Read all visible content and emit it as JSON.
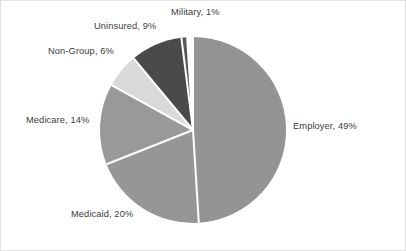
{
  "chart_data": {
    "type": "pie",
    "title": "",
    "subtitle": "",
    "xlabel": "",
    "ylabel": "",
    "legend_position": "none",
    "grid": false,
    "labels_format": "{name}, {value}%",
    "start_angle_deg": 0,
    "direction": "clockwise",
    "categories": [
      "Employer",
      "Medicaid",
      "Medicare",
      "Non-Group",
      "Uninsured",
      "Military"
    ],
    "values": [
      49,
      20,
      14,
      6,
      9,
      1
    ],
    "total": 99,
    "slices": [
      {
        "name": "Employer",
        "value": 49,
        "label": "Employer, 49%",
        "color": "#949494",
        "start_deg": 0,
        "end_deg": 176.4
      },
      {
        "name": "Medicaid",
        "value": 20,
        "label": "Medicaid, 20%",
        "color": "#969696",
        "start_deg": 176.4,
        "end_deg": 248.4
      },
      {
        "name": "Medicare",
        "value": 14,
        "label": "Medicare, 14%",
        "color": "#999999",
        "start_deg": 248.4,
        "end_deg": 298.8
      },
      {
        "name": "Non-Group",
        "value": 6,
        "label": "Non-Group, 6%",
        "color": "#d9d9d9",
        "start_deg": 298.8,
        "end_deg": 320.4
      },
      {
        "name": "Uninsured",
        "value": 9,
        "label": "Uninsured, 9%",
        "color": "#4a4a4a",
        "start_deg": 320.4,
        "end_deg": 352.8
      },
      {
        "name": "Military",
        "value": 1,
        "label": "Military, 1%",
        "color": "#595959",
        "start_deg": 352.8,
        "end_deg": 356.4
      }
    ],
    "geometry": {
      "center_x": 192,
      "center_y": 129,
      "radius": 93,
      "separator_color": "#ffffff",
      "separator_width": 2
    },
    "style": {
      "background": "#ffffff",
      "border_color": "#e2e2e2",
      "label_color": "#3b3b3b"
    }
  }
}
